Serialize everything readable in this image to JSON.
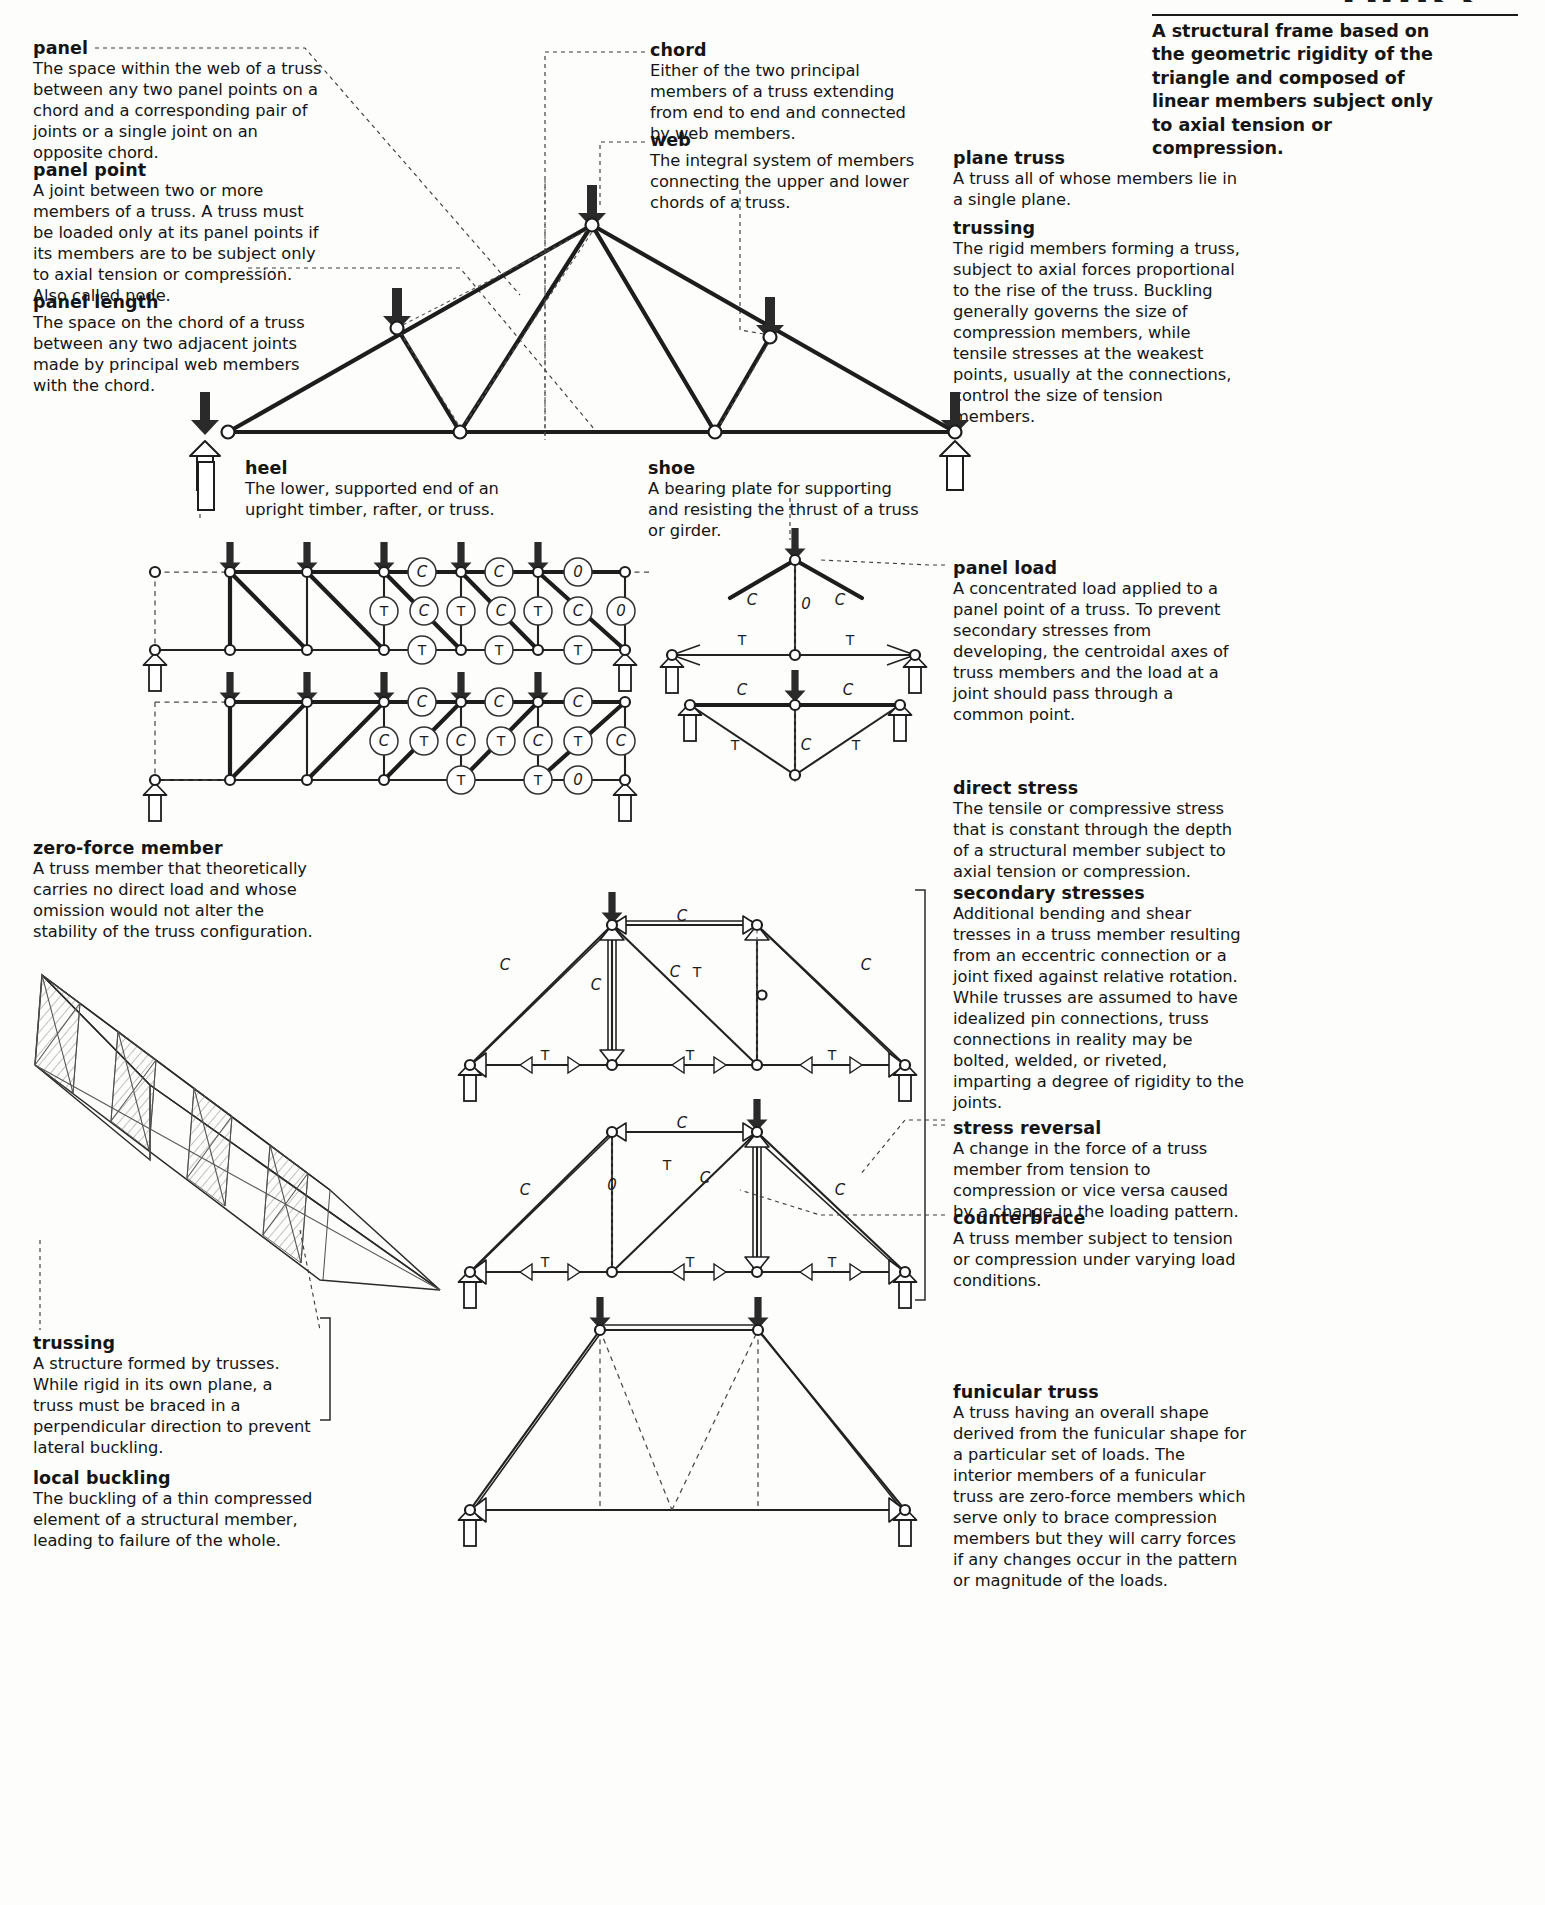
{
  "header": {
    "title": "TRUSS",
    "lead": "A structural frame based on the geometric rigidity of the triangle and composed of linear members subject only to axial tension or compression."
  },
  "left_column": [
    {
      "term": "panel",
      "definition": "The space within the web of a truss between any two panel points on a chord and a corresponding pair of joints or a single joint on an opposite chord."
    },
    {
      "term": "panel point",
      "definition": "A joint between two or more members of a truss. A truss must be loaded only at its panel points if its members are to be subject only to axial tension or compression. Also called node."
    },
    {
      "term": "panel length",
      "definition": "The space on the chord of a truss between any two adjacent joints made by principal web members with the chord."
    },
    {
      "term": "zero-force member",
      "definition": "A truss member that theoretically carries no direct load and whose omission would not alter the stability of the truss configuration."
    },
    {
      "term": "trussing",
      "definition": "A structure formed by trusses. While rigid in its own plane, a truss must be braced in a perpendicular direction to prevent lateral buckling."
    },
    {
      "term": "local buckling",
      "definition": "The buckling of a thin compressed element of a structural member, leading to failure of the whole."
    }
  ],
  "center_column": [
    {
      "term": "chord",
      "definition": "Either of the two principal members of a truss extending from end to end and connected by web members."
    },
    {
      "term": "web",
      "definition": "The integral system of members connecting the upper and lower chords of a truss."
    },
    {
      "term": "heel",
      "definition": "The lower, supported end of an upright timber, rafter, or truss."
    },
    {
      "term": "shoe",
      "definition": "A bearing plate for supporting and resisting the thrust of a truss or girder."
    }
  ],
  "right_column": [
    {
      "term": "plane truss",
      "definition": "A truss all of whose members lie in a single plane."
    },
    {
      "term": "trussing",
      "definition": "The rigid members forming a truss, subject to axial forces proportional to the rise of the truss. Buckling generally governs the size of compression members, while tensile stresses at the weakest points, usually at the connections, control the size of tension members."
    },
    {
      "term": "panel load",
      "definition": "A concentrated load applied to a panel point of a truss. To prevent secondary stresses from developing, the centroidal axes of truss members and the load at a joint should pass through a common point."
    },
    {
      "term": "direct stress",
      "definition": "The tensile or compressive stress that is constant through the depth of a structural member subject to axial tension or compression."
    },
    {
      "term": "secondary stresses",
      "definition": "Additional bending and shear tresses in a truss member resulting from an eccentric connection or a joint fixed against relative rotation. While trusses are assumed to have idealized pin connections, truss connections in reality may be bolted, welded, or riveted, imparting a degree of rigidity to the joints."
    },
    {
      "term": "stress reversal",
      "definition": "A change in the force of a truss member from tension to compression or vice versa caused by a change in the loading pattern."
    },
    {
      "term": "counterbrace",
      "definition": "A truss member subject to tension or compression under varying load conditions."
    },
    {
      "term": "funicular truss",
      "definition": "A truss having an overall shape derived from the funicular shape for a particular set of loads. The interior members of a funicular truss are zero-force members which serve only to brace compression members but they will carry forces if any changes occur in the pattern or magnitude of the loads."
    }
  ],
  "force_labels": {
    "tension": "T",
    "compression": "C",
    "zero": "0"
  },
  "diagrams": {
    "fink_truss": {
      "name": "fink-roof-truss",
      "load_arrow_count": 5,
      "support_count": 2
    },
    "pratt_truss_top": {
      "name": "pratt-truss-tension-diagonals",
      "top_chord": [
        "C",
        "C",
        "0"
      ],
      "web": [
        "T",
        "C",
        "T",
        "C",
        "T",
        "C",
        "0"
      ],
      "bottom_chord": [
        "T",
        "T",
        "T"
      ],
      "load_arrow_count": 5
    },
    "pratt_truss_bottom": {
      "name": "pratt-truss-compression-diagonals",
      "top_chord": [
        "C",
        "C",
        "C"
      ],
      "web": [
        "C",
        "T",
        "C",
        "T",
        "C",
        "T",
        "C"
      ],
      "bottom_chord": [
        "T",
        "T",
        "0"
      ],
      "load_arrow_count": 5
    },
    "joint_detail_upper": {
      "name": "joint-equilibrium-upper",
      "labels": [
        "C",
        "C",
        "T",
        "T",
        "0"
      ]
    },
    "joint_detail_lower": {
      "name": "joint-equilibrium-lower",
      "labels": [
        "C",
        "C",
        "T",
        "T",
        "C"
      ]
    },
    "secondary_stress_truss": {
      "name": "secondary-stress-truss",
      "labels": [
        "C",
        "C",
        "C",
        "C",
        "C",
        "T",
        "T",
        "T",
        "T"
      ]
    },
    "stress_reversal_truss": {
      "name": "stress-reversal-truss",
      "labels": [
        "C",
        "C",
        "C",
        "T",
        "C",
        "0",
        "T",
        "T",
        "T"
      ]
    },
    "funicular_truss": {
      "name": "funicular-truss",
      "labels": []
    }
  }
}
